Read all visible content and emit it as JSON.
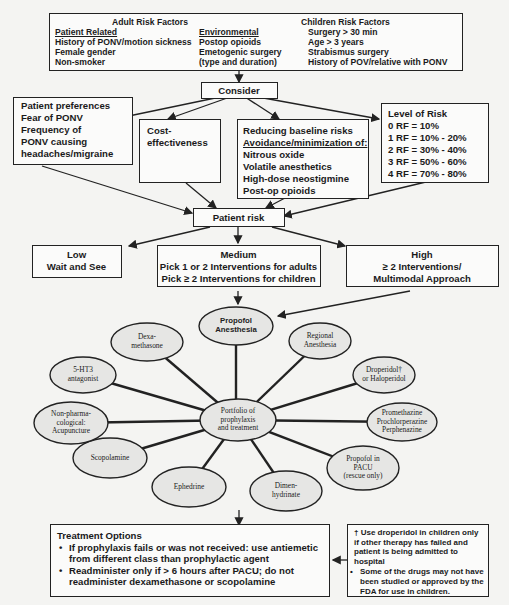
{
  "risk_factors": {
    "adult_title": "Adult Risk Factors",
    "patient_related": {
      "heading": "Patient Related",
      "items": [
        "History of PONV/motion sickness",
        "Female gender",
        "Non-smoker"
      ]
    },
    "environmental": {
      "heading": "Environmental",
      "items": [
        "Postop opioids",
        "Emetogenic surgery",
        "(type and duration)"
      ]
    },
    "children_title": "Children Risk Factors",
    "children_items": [
      "Surgery > 30 min",
      "Age > 3 years",
      "Strabismus surgery",
      "History of POV/relative with PONV"
    ]
  },
  "consider": {
    "label": "Consider"
  },
  "patient_preferences": {
    "title": "Patient preferences",
    "lines": [
      "Fear of PONV",
      "Frequency of",
      "PONV causing",
      "headaches/migraine"
    ]
  },
  "cost_effectiveness": {
    "lines": [
      "Cost-",
      "effectiveness"
    ]
  },
  "reducing_baseline": {
    "title": "Reducing baseline risks",
    "subtitle": "Avoidance/minimization of:",
    "items": [
      "Nitrous oxide",
      "Volatile anesthetics",
      "High-dose neostigmine",
      "Post-op opioids"
    ]
  },
  "level_of_risk": {
    "title": "Level of Risk",
    "items": [
      "0 RF = 10%",
      "1 RF = 10% - 20%",
      "2 RF = 30% - 40%",
      "3 RF = 50% - 60%",
      "4 RF = 70% - 80%"
    ]
  },
  "patient_risk": {
    "label": "Patient risk"
  },
  "risk_levels": {
    "low": {
      "title": "Low",
      "lines": [
        "Wait and See"
      ]
    },
    "medium": {
      "title": "Medium",
      "lines": [
        "Pick 1 or 2 Interventions for adults",
        "Pick ≥ 2 Interventions for children"
      ]
    },
    "high": {
      "title": "High",
      "lines": [
        "≥ 2 Interventions/",
        "Multimodal Approach"
      ]
    }
  },
  "portfolio": {
    "center": [
      "Portfolio of",
      "prophylaxis",
      "and treatment"
    ],
    "nodes": [
      {
        "id": "propofol-anesthesia",
        "lines": [
          "Propofol",
          "Anesthesia"
        ],
        "cx": 236,
        "cy": 326,
        "rx": 37,
        "ry": 19,
        "sans": true
      },
      {
        "id": "regional-anesthesia",
        "lines": [
          "Regional",
          "Anesthesia"
        ],
        "cx": 320,
        "cy": 341,
        "rx": 31,
        "ry": 18
      },
      {
        "id": "droperidol",
        "lines": [
          "Droperidol†",
          "or Haloperidol"
        ],
        "cx": 384,
        "cy": 375,
        "rx": 31,
        "ry": 18
      },
      {
        "id": "promethazine",
        "lines": [
          "Promethazine",
          "Prochlorperazine",
          "Perphenazine"
        ],
        "cx": 402,
        "cy": 422,
        "rx": 35,
        "ry": 19
      },
      {
        "id": "propofol-pacu",
        "lines": [
          "Propofol in",
          "PACU",
          "(rescue only)"
        ],
        "cx": 363,
        "cy": 468,
        "rx": 36,
        "ry": 22
      },
      {
        "id": "dimenhydrinate",
        "lines": [
          "Dimen-",
          "hydrinate"
        ],
        "cx": 286,
        "cy": 491,
        "rx": 36,
        "ry": 20
      },
      {
        "id": "ephedrine",
        "lines": [
          "Ephedrine"
        ],
        "cx": 189,
        "cy": 487,
        "rx": 37,
        "ry": 20
      },
      {
        "id": "scopolamine",
        "lines": [
          "Scopolamine"
        ],
        "cx": 110,
        "cy": 458,
        "rx": 37,
        "ry": 20
      },
      {
        "id": "non-pharmacological",
        "lines": [
          "Non-pharma-",
          "cological:",
          "Acupuncture"
        ],
        "cx": 71,
        "cy": 423,
        "rx": 37,
        "ry": 21
      },
      {
        "id": "5ht3-antagonist",
        "lines": [
          "5-HT3",
          "antagonist"
        ],
        "cx": 83,
        "cy": 375,
        "rx": 33,
        "ry": 18
      },
      {
        "id": "dexamethasone",
        "lines": [
          "Dexa-",
          "methasone"
        ],
        "cx": 147,
        "cy": 342,
        "rx": 36,
        "ry": 19
      }
    ],
    "center_pos": {
      "cx": 238,
      "cy": 420,
      "rx": 38,
      "ry": 21
    }
  },
  "treatment_options": {
    "title": "Treatment Options",
    "bullets": [
      [
        "If prophylaxis fails or was not received: use antiemetic",
        "from different class than prophylactic agent"
      ],
      [
        "Readminister only if > 6 hours after PACU; do not",
        "readminister dexamethasone or scopolamine"
      ]
    ]
  },
  "footnote": {
    "lines": [
      "† Use droperidol in children only",
      "if other therapy has failed and",
      "patient is being admitted to",
      "hospital"
    ],
    "bullet": [
      "Some of the drugs may not have",
      "been studied or approved by the",
      "FDA for use in children."
    ]
  }
}
